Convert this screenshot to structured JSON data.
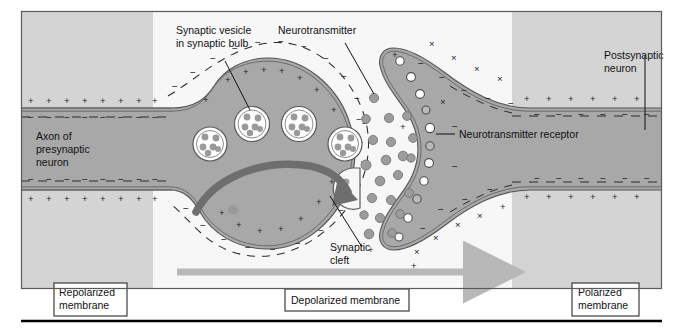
{
  "figure": {
    "type": "biological-diagram"
  },
  "labels": {
    "synaptic_vesicle_l1": "Synaptic vesicle",
    "synaptic_vesicle_l2": "in synaptic bulb",
    "neurotransmitter": "Neurotransmitter",
    "postsynaptic_l1": "Postsynaptic",
    "postsynaptic_l2": "neuron",
    "axon_l1": "Axon of",
    "axon_l2": "presynaptic",
    "axon_l3": "neuron",
    "receptor": "Neurotransmitter receptor",
    "cleft_l1": "Synaptic",
    "cleft_l2": "cleft"
  },
  "boxes": {
    "repolarized_l1": "Repolarized",
    "repolarized_l2": "membrane",
    "depolarized": "Depolarized membrane",
    "polarized_l1": "Polarized",
    "polarized_l2": "membrane"
  },
  "charges": {
    "positive": "+",
    "negative": "−",
    "outside_positive": "+",
    "outside_negative": "−"
  },
  "colors": {
    "zone_polarized": "#d4d4d4",
    "zone_depolarized": "#f7f7f7",
    "cell_fill": "#a8a8a8",
    "cell_stroke": "#545454",
    "membrane_line": "#6a6a6a",
    "vesicle_fill": "#ffffff",
    "vesicle_dot": "#9a9a9a",
    "neurotransmitter_dot": "#a0a0a0",
    "arrow_gray": "#b8b8b8",
    "arrow_dark": "#6e6e6e",
    "border": "#5a5a5a",
    "text": "#111111",
    "rule": "#000000"
  },
  "zones": {
    "left_boundary_x": 153,
    "right_boundary_x": 512
  },
  "counts": {
    "vesicles_in_bulb": 4,
    "receptors": 11,
    "free_neurotransmitters": 21
  }
}
